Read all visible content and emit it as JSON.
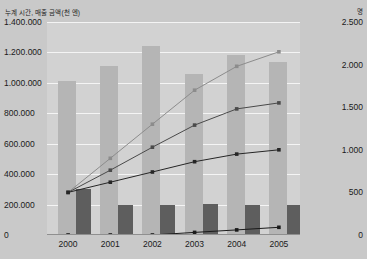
{
  "axis": {
    "left_unit_label": "누계 시간, 매출 금액(천 엔)",
    "right_unit_label": "명",
    "left_ticks": [
      "1.400.000",
      "1.200.000",
      "1.000.000",
      "800.000",
      "600.000",
      "400.000",
      "200.000",
      "0"
    ],
    "right_ticks": [
      "2.500",
      "2.000",
      "1.500",
      "1.000",
      "500",
      "0"
    ]
  },
  "chart_data": {
    "type": "bar",
    "title": "",
    "subtitle": "",
    "xlabel": "",
    "ylabel": "누계 시간, 매출 금액(천 엔)",
    "y2label": "명",
    "categories": [
      "2000",
      "2001",
      "2002",
      "2003",
      "2004",
      "2005"
    ],
    "ylim": [
      0,
      1400000
    ],
    "y2lim": [
      0,
      2500
    ],
    "grid": true,
    "legend": "none",
    "colors": {
      "bar_light": "#b5b5b5",
      "bar_dark": "#5e5e5e",
      "line_light": "#8c8c8c",
      "line_mid": "#4a4a4a",
      "line_dark": "#262626",
      "plot_background": "#d2d2d2",
      "page_background": "#c9c9c9",
      "gridline": "#f4f4f4"
    },
    "series": [
      {
        "name": "누계 매출 금액",
        "type": "bar",
        "axis": "left",
        "color": "#b5b5b5",
        "values": [
          1010000,
          1110000,
          1240000,
          1060000,
          1180000,
          1140000
        ]
      },
      {
        "name": "연간 매출 금액",
        "type": "bar",
        "axis": "left",
        "color": "#5e5e5e",
        "values": [
          300000,
          195000,
          200000,
          205000,
          200000,
          195000
        ]
      },
      {
        "name": "누계 이용자 수",
        "type": "line",
        "axis": "right",
        "color": "#8c8c8c",
        "values": [
          500,
          900,
          1300,
          1700,
          1980,
          2150
        ]
      },
      {
        "name": "누계 시간",
        "type": "line",
        "axis": "right",
        "color": "#4a4a4a",
        "values": [
          500,
          760,
          1030,
          1290,
          1480,
          1550
        ]
      },
      {
        "name": "연간 이용자 수",
        "type": "line",
        "axis": "right",
        "color": "#262626",
        "values": [
          500,
          620,
          740,
          860,
          950,
          1000
        ]
      },
      {
        "name": "연간 시간",
        "type": "line",
        "axis": "right",
        "color": "#1a1a1a",
        "values": [
          0,
          0,
          0,
          30,
          60,
          90
        ]
      }
    ]
  }
}
